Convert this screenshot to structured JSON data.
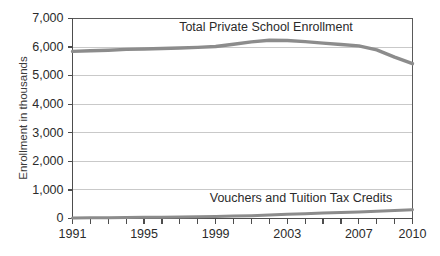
{
  "chart_data": {
    "type": "line",
    "title": "",
    "xlabel": "",
    "ylabel": "Enrollment in thousands",
    "ylim": [
      0,
      7000
    ],
    "xlim": [
      1991,
      2010
    ],
    "grid": true,
    "legend": "inline-labels",
    "y_ticks": [
      "0",
      "1,000",
      "2,000",
      "3,000",
      "4,000",
      "5,000",
      "6,000",
      "7,000"
    ],
    "y_tick_values": [
      0,
      1000,
      2000,
      3000,
      4000,
      5000,
      6000,
      7000
    ],
    "x_tick_values": [
      1991,
      1992,
      1993,
      1994,
      1995,
      1996,
      1997,
      1998,
      1999,
      2000,
      2001,
      2002,
      2003,
      2004,
      2005,
      2006,
      2007,
      2008,
      2009,
      2010
    ],
    "x_tick_labels_shown": [
      "1991",
      "1995",
      "1999",
      "2003",
      "2007",
      "2010"
    ],
    "x": [
      1991,
      1992,
      1993,
      1994,
      1995,
      1996,
      1997,
      1998,
      1999,
      2000,
      2001,
      2002,
      2003,
      2004,
      2005,
      2006,
      2007,
      2008,
      2009,
      2010
    ],
    "series": [
      {
        "name": "Total Private School Enrollment",
        "label": "Total Private School Enrollment",
        "color": "#8c8c8c",
        "values": [
          5850,
          5870,
          5890,
          5920,
          5930,
          5950,
          5970,
          5990,
          6020,
          6100,
          6180,
          6240,
          6230,
          6190,
          6140,
          6090,
          6040,
          5900,
          5650,
          5420
        ]
      },
      {
        "name": "Vouchers and Tuition Tax Credits",
        "label": "Vouchers and Tuition Tax Credits",
        "color": "#8c8c8c",
        "values": [
          20,
          25,
          30,
          35,
          40,
          45,
          52,
          60,
          70,
          85,
          100,
          120,
          145,
          170,
          190,
          210,
          230,
          255,
          280,
          310
        ]
      }
    ]
  }
}
